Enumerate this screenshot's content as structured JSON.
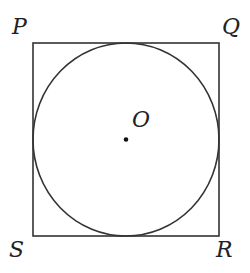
{
  "figure": {
    "type": "circle inscribed in square",
    "square": {
      "vertices": {
        "top_left": "P",
        "top_right": "Q",
        "bottom_right": "R",
        "bottom_left": "S"
      },
      "x": 33,
      "y": 43,
      "size": 186
    },
    "circle": {
      "center_label": "O",
      "cx": 126,
      "cy": 139.5,
      "r": 93
    },
    "stroke_color": "#333333",
    "labels": {
      "p": "P",
      "q": "Q",
      "r": "R",
      "s": "S",
      "o": "O"
    }
  }
}
